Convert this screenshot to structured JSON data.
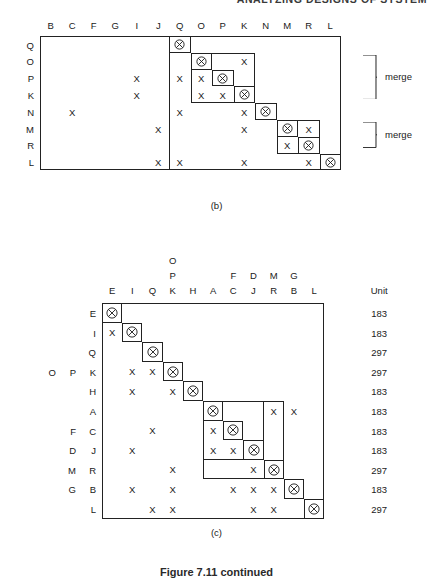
{
  "running_head": "ANALYZING DESIGNS OF SYSTEM",
  "figure_caption": "Figure 7.11 continued",
  "panel_b": {
    "caption": "(b)",
    "col_headers": [
      "B",
      "C",
      "F",
      "G",
      "I",
      "J",
      "Q",
      "O",
      "P",
      "K",
      "N",
      "M",
      "R",
      "L"
    ],
    "row_labels": [
      "Q",
      "O",
      "P",
      "K",
      "N",
      "M",
      "R",
      "L"
    ],
    "row_col_index": [
      6,
      7,
      8,
      9,
      10,
      11,
      12,
      13
    ],
    "marks": [
      {
        "row": 1,
        "col": 9
      },
      {
        "row": 2,
        "col": 4
      },
      {
        "row": 2,
        "col": 6
      },
      {
        "row": 2,
        "col": 7
      },
      {
        "row": 3,
        "col": 4
      },
      {
        "row": 3,
        "col": 7
      },
      {
        "row": 3,
        "col": 8
      },
      {
        "row": 4,
        "col": 1
      },
      {
        "row": 4,
        "col": 6
      },
      {
        "row": 4,
        "col": 9
      },
      {
        "row": 5,
        "col": 5
      },
      {
        "row": 5,
        "col": 9
      },
      {
        "row": 5,
        "col": 12
      },
      {
        "row": 6,
        "col": 11
      },
      {
        "row": 7,
        "col": 5
      },
      {
        "row": 7,
        "col": 6
      },
      {
        "row": 7,
        "col": 9
      },
      {
        "row": 7,
        "col": 12
      }
    ],
    "clusters": [
      {
        "r0": 1,
        "r1": 3,
        "c0": 7,
        "c1": 9
      },
      {
        "r0": 5,
        "r1": 6,
        "c0": 11,
        "c1": 12
      }
    ],
    "merge_labels": [
      "merge",
      "merge"
    ]
  },
  "panel_c": {
    "caption": "(c)",
    "col_headers": [
      "E",
      "I",
      "Q",
      "K",
      "H",
      "A",
      "C",
      "J",
      "R",
      "B",
      "L"
    ],
    "col_headers_mid": [
      "",
      "",
      "",
      "P",
      "",
      "",
      "F",
      "D",
      "M",
      "G",
      ""
    ],
    "col_headers_top": [
      "",
      "",
      "",
      "O",
      "",
      "",
      "",
      "",
      "",
      "",
      ""
    ],
    "row_labels": [
      "E",
      "I",
      "Q",
      "K",
      "H",
      "A",
      "C",
      "J",
      "R",
      "B",
      "L"
    ],
    "row_labels_mid": [
      "",
      "",
      "",
      "P",
      "",
      "",
      "F",
      "D",
      "M",
      "G",
      ""
    ],
    "row_labels_left": [
      "",
      "",
      "",
      "O",
      "",
      "",
      "",
      "",
      "",
      "",
      ""
    ],
    "unit_header": "Unit",
    "unit_values": [
      "183",
      "183",
      "297",
      "297",
      "183",
      "183",
      "183",
      "183",
      "297",
      "183",
      "297"
    ],
    "marks": [
      {
        "row": 1,
        "col": 0
      },
      {
        "row": 3,
        "col": 1
      },
      {
        "row": 3,
        "col": 2
      },
      {
        "row": 4,
        "col": 1
      },
      {
        "row": 4,
        "col": 3
      },
      {
        "row": 5,
        "col": 8
      },
      {
        "row": 5,
        "col": 9
      },
      {
        "row": 6,
        "col": 2
      },
      {
        "row": 6,
        "col": 5
      },
      {
        "row": 7,
        "col": 1
      },
      {
        "row": 7,
        "col": 5
      },
      {
        "row": 7,
        "col": 6
      },
      {
        "row": 8,
        "col": 3
      },
      {
        "row": 8,
        "col": 7
      },
      {
        "row": 9,
        "col": 1
      },
      {
        "row": 9,
        "col": 3
      },
      {
        "row": 9,
        "col": 6
      },
      {
        "row": 9,
        "col": 7
      },
      {
        "row": 9,
        "col": 8
      },
      {
        "row": 10,
        "col": 2
      },
      {
        "row": 10,
        "col": 3
      },
      {
        "row": 10,
        "col": 7
      },
      {
        "row": 10,
        "col": 8
      }
    ],
    "clusters": [
      {
        "r0": 5,
        "r1": 7,
        "c0": 5,
        "c1": 7
      },
      {
        "r0": 5,
        "r1": 8,
        "c0": 5,
        "c1": 8
      }
    ]
  }
}
